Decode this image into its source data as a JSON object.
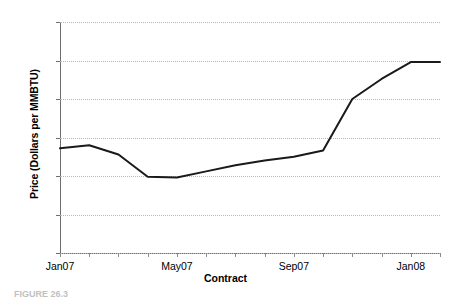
{
  "figure": {
    "caption_partial": "FIGURE  26.3"
  },
  "chart_data": {
    "type": "line",
    "title": "",
    "xlabel": "Contract",
    "ylabel": "Price (Dollars per MMBTU)",
    "ylim": [
      7.0,
      10.0
    ],
    "ytick_labels": [
      "7.0",
      "7.5",
      "8.0",
      "8.5",
      "9.0",
      "9.5",
      "10.0"
    ],
    "ytick_values": [
      7.0,
      7.5,
      8.0,
      8.5,
      9.0,
      9.5,
      10.0
    ],
    "xtick_labels": [
      "Jan07",
      "May07",
      "Sep07",
      "Jan08"
    ],
    "xtick_values": [
      0,
      4,
      8,
      12
    ],
    "grid": "horizontal-dotted",
    "legend": "none",
    "line_color": "#1a1a1a",
    "line_width": 2.0,
    "x": [
      0,
      1,
      2,
      3,
      4,
      5,
      6,
      7,
      8,
      9,
      10,
      11,
      12,
      13
    ],
    "categories": [
      "Jan07",
      "Feb07",
      "Mar07",
      "Apr07",
      "May07",
      "Jun07",
      "Jul07",
      "Aug07",
      "Sep07",
      "Oct07",
      "Nov07",
      "Dec07",
      "Jan08",
      "Feb08"
    ],
    "values": [
      8.36,
      8.4,
      8.28,
      7.99,
      7.98,
      8.06,
      8.14,
      8.2,
      8.25,
      8.33,
      9.0,
      9.26,
      9.48,
      9.48
    ]
  }
}
